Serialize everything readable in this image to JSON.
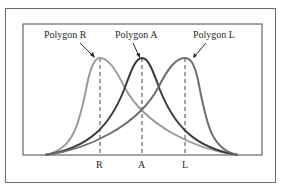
{
  "diagram": {
    "polygons": [
      {
        "id": "R",
        "label": "Polygon R",
        "tick": "R",
        "peak_x": 100,
        "color": "#9a9a9a"
      },
      {
        "id": "A",
        "label": "Polygon A",
        "tick": "A",
        "peak_x": 142,
        "color": "#3a3a3a"
      },
      {
        "id": "L",
        "label": "Polygon L",
        "tick": "L",
        "peak_x": 185,
        "color": "#6e6e6e"
      }
    ]
  }
}
